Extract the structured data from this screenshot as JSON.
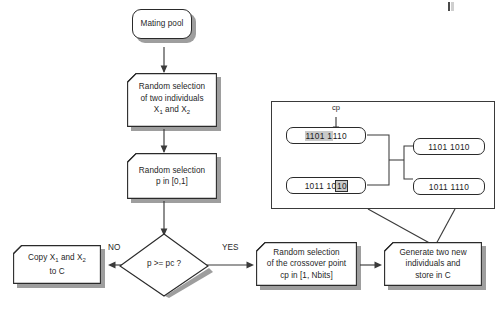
{
  "diagram": {
    "colors": {
      "stroke": "#2a2a2a",
      "shadow": "#9e9e9e",
      "highlight": "#c9c9c9",
      "background": "#ffffff"
    }
  },
  "nodes": {
    "mating_pool": {
      "label": "Mating pool",
      "shape": "rounded-terminal"
    },
    "random_individuals": {
      "line1": "Random selection",
      "line2": "of two individuals",
      "line3_pre": "X",
      "line3_sub1": "1",
      "line3_mid": " and X",
      "line3_sub2": "2",
      "shape": "document"
    },
    "random_p": {
      "line1": "Random selection",
      "line2": "p in [0,1]",
      "shape": "document"
    },
    "decision": {
      "label": "p >= pc ?",
      "shape": "diamond"
    },
    "copy_to_c": {
      "line1_pre": "Copy X",
      "line1_sub1": "1",
      "line1_mid": " and X",
      "line1_sub2": "2",
      "line2": "to C",
      "shape": "document"
    },
    "crossover_point": {
      "line1": "Random selection",
      "line2": "of the crossover point",
      "line3": "cp in [1, Nbits]",
      "shape": "document"
    },
    "generate_new": {
      "line1": "Generate two new",
      "line2": "individuals and",
      "line3": "store in C",
      "shape": "document"
    }
  },
  "edges": {
    "no_label": "NO",
    "yes_label": "YES"
  },
  "panel": {
    "cp_label": "cp",
    "parent1": {
      "head": "1101 1",
      "tail": "110"
    },
    "parent2": {
      "head": "1011 10",
      "tail": "10"
    },
    "child1": "1101 1010",
    "child2": "1011 1110"
  }
}
